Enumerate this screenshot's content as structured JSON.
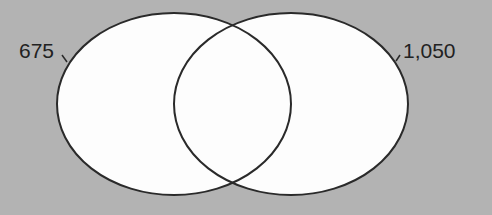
{
  "diagram": {
    "type": "venn",
    "sets": [
      {
        "label": "675",
        "cx": 174,
        "cy": 104,
        "rx": 117,
        "ry": 91
      },
      {
        "label": "1,050",
        "cx": 291,
        "cy": 104,
        "rx": 117,
        "ry": 91
      }
    ],
    "colors": {
      "background": "#b3b3b3",
      "fill": "#ffffff",
      "stroke": "#2a2a2a"
    }
  }
}
